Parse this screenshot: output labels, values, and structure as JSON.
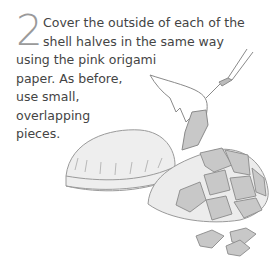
{
  "step": {
    "number": "2",
    "lines": [
      "Cover the outside of each of the",
      "shell halves in the same way",
      "using the pink origami",
      "paper. As before,",
      "use small,",
      "overlapping",
      "pieces."
    ]
  },
  "illustration": {
    "description": "Hand holding a brush pasting small overlapping paper pieces onto one of two shell halves",
    "colors": {
      "line": "#8a8a8a",
      "shell": "#ececec",
      "piece": "#c8c8c8"
    }
  }
}
